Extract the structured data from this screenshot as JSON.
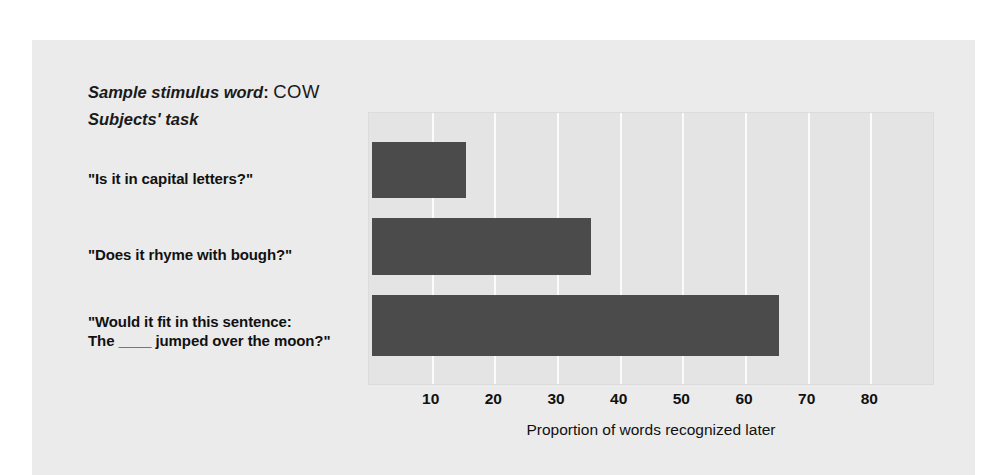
{
  "figure": {
    "header": {
      "stimulus_label": "Sample stimulus word",
      "stimulus_colon": ":",
      "stimulus_word": "COW",
      "task_label": "Subjects' task"
    }
  },
  "chart_data": {
    "type": "bar",
    "orientation": "horizontal",
    "title": "",
    "xlabel": "Proportion of words recognized later",
    "ylabel": "",
    "categories": [
      "\"Is it in capital letters?\"",
      "\"Does it rhyme with bough?\"",
      "\"Would it fit in this sentence:\nThe ____ jumped over the moon?\""
    ],
    "category_lines": [
      [
        "\"Is it in capital letters?\""
      ],
      [
        "\"Does it rhyme with bough?\""
      ],
      [
        "\"Would it fit in this sentence:",
        "The ____ jumped over the moon?\""
      ]
    ],
    "values": [
      15,
      35,
      65
    ],
    "xlim": [
      0,
      90
    ],
    "xticks": [
      10,
      20,
      30,
      40,
      50,
      60,
      70,
      80
    ],
    "xtick_labels": [
      "10",
      "20",
      "30",
      "40",
      "50",
      "60",
      "70",
      "80"
    ],
    "grid": "vertical-white",
    "legend": "none",
    "colors": {
      "bar": "#4b4b4b",
      "plot_background": "#e4e4e4",
      "figure_background": "#ebebeb",
      "gridline": "#fbfbfb",
      "text": "#111111"
    }
  }
}
